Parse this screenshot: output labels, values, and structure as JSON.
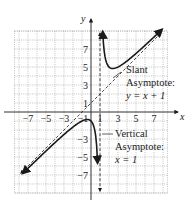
{
  "chart_data": {
    "type": "line",
    "title": "",
    "xlabel": "x",
    "ylabel": "y",
    "xlim": [
      -8.5,
      8.5
    ],
    "ylim": [
      -9,
      9
    ],
    "grid": true,
    "grid_step": 1,
    "x_ticks": [
      -7,
      -5,
      -3,
      -1,
      1,
      3,
      5,
      7
    ],
    "x_tick_labels": [
      "−7",
      "−5",
      "−3",
      "−1",
      "1",
      "3",
      "5",
      "7"
    ],
    "y_ticks": [
      7,
      5,
      3,
      1,
      -3,
      -5,
      -7
    ],
    "y_tick_labels": [
      "7",
      "5",
      "3",
      "1",
      "−3",
      "−5",
      "−7"
    ],
    "function": {
      "expression": "f(x) = (x^2 + 1)/(x - 1)",
      "local_min": [
        2.41,
        4.83
      ],
      "local_max": [
        -0.41,
        -0.83
      ]
    },
    "series": [
      {
        "name": "f(x) right branch",
        "style": "solid",
        "x_range": [
          1.3,
          7.9
        ]
      },
      {
        "name": "f(x) left branch",
        "style": "solid",
        "x_range": [
          -7.6,
          0.73
        ]
      },
      {
        "name": "slant asymptote",
        "style": "dashed",
        "equation": "y = x + 1",
        "x_range": [
          -7.8,
          7.8
        ]
      },
      {
        "name": "vertical asymptote",
        "style": "dashed",
        "equation": "x = 1",
        "y_range": [
          -8.8,
          8.8
        ]
      }
    ],
    "annotations": [
      {
        "id": "slant",
        "lines": [
          "Slant",
          "Asymptote:",
          "y = x + 1"
        ],
        "points_to": "slant asymptote"
      },
      {
        "id": "vertical",
        "lines": [
          "Vertical",
          "Asymptote:",
          "x = 1"
        ],
        "points_to": "vertical asymptote"
      }
    ],
    "colors": {
      "curve": "#1a1a1a",
      "grid": "#9a9a9a",
      "axis": "#1a1a1a"
    }
  }
}
